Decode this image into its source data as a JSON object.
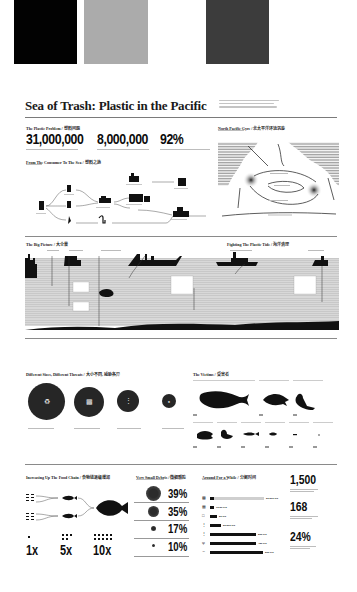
{
  "swatches": [
    {
      "color": "#020202"
    },
    {
      "color": "#ababab"
    },
    {
      "color": "#3c3c3c"
    }
  ],
  "poster": {
    "title": "Sea of Trash: Plastic in the Pacific",
    "plastic_problem": {
      "heading": "The Plastic Problem / 塑料问题",
      "stats": [
        {
          "value": "31,000,000"
        },
        {
          "value": "8,000,000"
        },
        {
          "value": "92%"
        }
      ]
    },
    "consumer_to_sea": {
      "heading": "From The Consumer To The Sea / 塑料之旅"
    },
    "north_pacific_gyre": {
      "heading": "North Pacific Gyre / 北太平洋环流涡旋"
    },
    "big_picture": {
      "heading": "The Big Picture / 大全景"
    },
    "fighting_tide": {
      "heading": "Fighting The Plastic Tide / 海洋清理"
    },
    "different_sizes": {
      "heading": "Different Sizes, Different Threats / 大小不同, 威胁各异"
    },
    "victims": {
      "heading": "The Victims / 受害者"
    },
    "food_chain": {
      "heading": "Increasing Up The Food Chain / 食物链逐级增加",
      "multipliers": [
        "1x",
        "5x",
        "10x"
      ]
    },
    "small_debris": {
      "heading": "Very Small Debris / 微细颗粒",
      "percentages": [
        "39%",
        "35%",
        "17%",
        "10%"
      ]
    },
    "around_for_a_while": {
      "heading": "Around For a While / 分解时间",
      "bars": [
        {
          "value": "20-200 yrs",
          "pct": 0.85,
          "light": true
        },
        {
          "value": "10-20 yrs",
          "pct": 0.06,
          "light": false
        },
        {
          "value": "50 yrs",
          "pct": 0.12,
          "light": false
        },
        {
          "value": "50-200 yrs",
          "pct": 0.18,
          "light": false
        },
        {
          "value": "200 yrs",
          "pct": 0.74,
          "light": false
        },
        {
          "value": "450 yrs",
          "pct": 0.74,
          "light": false
        },
        {
          "value": "500 yrs",
          "pct": 0.86,
          "light": false
        }
      ]
    },
    "right_stats": [
      "1,500",
      "168",
      "24%"
    ]
  }
}
